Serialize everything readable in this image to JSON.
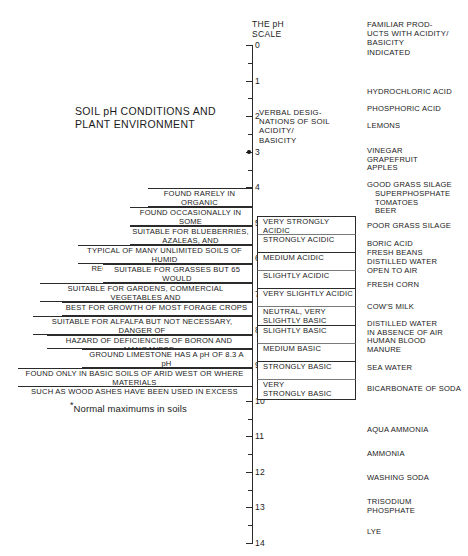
{
  "diagram": {
    "title": "SOIL pH CONDITIONS AND\nPLANT ENVIRONMENT",
    "footnote_marker": "*",
    "footnote": "Normal maximums in soils"
  },
  "scale": {
    "title": "THE pH\nSCALE",
    "min": 0,
    "max": 14,
    "ticks": [
      {
        "value": 0,
        "label": "0"
      },
      {
        "value": 0.5,
        "label": ""
      },
      {
        "value": 1,
        "label": "1"
      },
      {
        "value": 1.5,
        "label": ""
      },
      {
        "value": 2,
        "label": "2"
      },
      {
        "value": 2.5,
        "label": ""
      },
      {
        "value": 3,
        "label": "3"
      },
      {
        "value": 3.5,
        "label": ""
      },
      {
        "value": 4,
        "label": "4"
      },
      {
        "value": 4.5,
        "label": ""
      },
      {
        "value": 5,
        "label": "5"
      },
      {
        "value": 5.5,
        "label": ""
      },
      {
        "value": 6,
        "label": "6"
      },
      {
        "value": 6.5,
        "label": ""
      },
      {
        "value": 7,
        "label": "7"
      },
      {
        "value": 7.5,
        "label": ""
      },
      {
        "value": 8,
        "label": "8"
      },
      {
        "value": 8.5,
        "label": ""
      },
      {
        "value": 9,
        "label": "9"
      },
      {
        "value": 9.5,
        "label": ""
      },
      {
        "value": 10,
        "label": "10"
      },
      {
        "value": 10.5,
        "label": ""
      },
      {
        "value": 11,
        "label": "11"
      },
      {
        "value": 11.5,
        "label": ""
      },
      {
        "value": 12,
        "label": "12"
      },
      {
        "value": 12.5,
        "label": ""
      },
      {
        "value": 13,
        "label": "13"
      },
      {
        "value": 13.5,
        "label": ""
      },
      {
        "value": 14,
        "label": "14"
      }
    ],
    "markers": [
      {
        "value": 3.0,
        "label": "*"
      },
      {
        "value": 9.4,
        "label": "*"
      }
    ]
  },
  "columns": {
    "verbal_header": "VERBAL DESIG-\nNATIONS OF SOIL\nACIDITY/\nBASICITY",
    "familiar_header": "FAMILIAR PROD-\nUCTS WITH ACIDITY/\nBASICITY\nINDICATED"
  },
  "soil_conditions": [
    {
      "text": "FOUND RARELY IN ORGANIC\nSOIL SURFACE LAYERS",
      "top": 188,
      "height": 19,
      "left": 148,
      "align": "center"
    },
    {
      "text": "FOUND OCCASIONALLY IN SOME\nSOILS IN HUMID REGIONS",
      "top": 207,
      "height": 19,
      "left": 130,
      "align": "center"
    },
    {
      "text": "SUITABLE FOR BLUEBERRIES,\nAZALEAS, AND RHODODENRONS",
      "top": 226,
      "height": 19,
      "left": 130,
      "align": "center"
    },
    {
      "text": "TYPICAL OF MANY UNLIMITED SOILS OF HUMID\nREGIONS – SUITABLE FOR POTATOES",
      "top": 245,
      "height": 19,
      "left": 78,
      "align": "center"
    },
    {
      "text": "SUITABLE FOR GRASSES BUT 65 WOULD\nBE BETTER",
      "top": 264,
      "height": 19,
      "left": 103,
      "align": "center"
    },
    {
      "text": "SUITABLE FOR GARDENS, COMMERCIAL VEGETABLES AND\nGRASSES",
      "top": 283,
      "height": 19,
      "left": 40,
      "align": "center"
    },
    {
      "text": "BEST FOR GROWTH OF MOST FORAGE CROPS",
      "top": 302,
      "height": 14,
      "left": 62,
      "align": "center"
    },
    {
      "text": "SUITABLE FOR ALFALFA BUT NOT NECESSARY, DANGER OF\nOVERLIMING INJURY ON SANDY SOILS",
      "top": 316,
      "height": 19,
      "left": 33,
      "align": "center"
    },
    {
      "text": "HAZARD OF DEFICIENCIES OF BORON AND MANGANESE",
      "top": 335,
      "height": 14,
      "left": 47,
      "align": "center"
    },
    {
      "text": "GROUND LIMESTONE HAS A pH OF 8.3 A pH\nABOVE 8.3 IS CAUSED BY SODIUM",
      "top": 349,
      "height": 19,
      "left": 82,
      "align": "center"
    },
    {
      "text": "FOUND ONLY IN BASIC SOILS OF ARID WEST OR WHERE MATERIALS\nSUCH AS WOOD ASHES HAVE BEEN USED IN EXCESS",
      "top": 368,
      "height": 19,
      "left": 18,
      "align": "center"
    }
  ],
  "verbal_designations": [
    {
      "text": "VERY STRONGLY ACIDIC",
      "top": 216,
      "height": 18
    },
    {
      "text": "STRONGLY ACIDIC",
      "top": 234,
      "height": 18
    },
    {
      "text": "MEDIUM ACIDIC",
      "top": 252,
      "height": 18
    },
    {
      "text": "SLIGHTLY ACIDIC",
      "top": 270,
      "height": 18
    },
    {
      "text": "VERY SLIGHTLY ACIDIC",
      "top": 288,
      "height": 18
    },
    {
      "text": "NEUTRAL, VERY\nSLIGHTLY BASIC",
      "top": 306,
      "height": 19
    },
    {
      "text": "SLIGHTLY BASIC",
      "top": 325,
      "height": 18
    },
    {
      "text": "MEDIUM BASIC",
      "top": 343,
      "height": 18
    },
    {
      "text": "STRONGLY BASIC",
      "top": 361,
      "height": 18
    },
    {
      "text": "VERY\nSTRONGLY BASIC",
      "top": 379,
      "height": 21
    }
  ],
  "familiar_products": [
    {
      "text": "HYDROCHLORIC ACID",
      "top": 88,
      "indent": false
    },
    {
      "text": "PHOSPHORIC ACID",
      "top": 105,
      "indent": false
    },
    {
      "text": "LEMONS",
      "top": 122,
      "indent": false
    },
    {
      "text": "VINEGAR\nGRAPEFRUIT\nAPPLES",
      "top": 147,
      "indent": false
    },
    {
      "text": "GOOD GRASS SILAGE",
      "top": 181,
      "indent": false
    },
    {
      "text": "SUPERPHOSPHATE\nTOMATOES\nBEER",
      "top": 190,
      "indent": true
    },
    {
      "text": "POOR GRASS SILAGE",
      "top": 222,
      "indent": false
    },
    {
      "text": "BORIC ACID\nFRESH BEANS",
      "top": 240,
      "indent": false
    },
    {
      "text": "DISTILLED WATER\nOPEN TO AIR",
      "top": 258,
      "indent": false
    },
    {
      "text": "FRESH CORN",
      "top": 281,
      "indent": false
    },
    {
      "text": "COW'S MILK",
      "top": 303,
      "indent": false
    },
    {
      "text": "DISTILLED WATER\nIN ABSENCE OF AIR",
      "top": 320,
      "indent": false
    },
    {
      "text": "HUMAN BLOOD",
      "top": 337,
      "indent": false
    },
    {
      "text": "MANURE",
      "top": 346,
      "indent": false
    },
    {
      "text": "SEA WATER",
      "top": 364,
      "indent": false
    },
    {
      "text": "BICARBONATE OF SODA",
      "top": 385,
      "indent": false
    },
    {
      "text": "AQUA AMMONIA",
      "top": 426,
      "indent": false
    },
    {
      "text": "AMMONIA",
      "top": 450,
      "indent": false
    },
    {
      "text": "WASHING SODA",
      "top": 474,
      "indent": false
    },
    {
      "text": "TRISODIUM\nPHOSPHATE",
      "top": 498,
      "indent": false
    },
    {
      "text": "LYE",
      "top": 528,
      "indent": false
    }
  ],
  "colors": {
    "ink": "#1a1a1a",
    "rule": "#2b2b2b",
    "background": "#ffffff"
  }
}
